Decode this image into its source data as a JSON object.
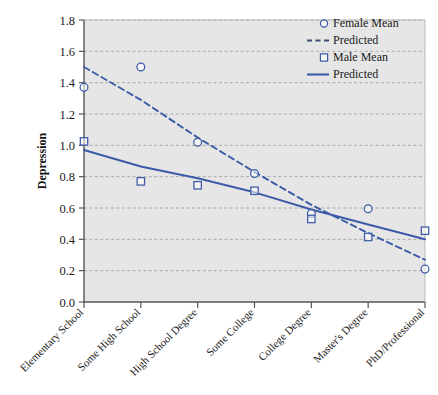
{
  "chart_data": {
    "type": "scatter",
    "title": "",
    "xlabel": "",
    "ylabel": "Depression",
    "ylim": [
      0.0,
      1.8
    ],
    "ytick_step": 0.2,
    "yticks": [
      "0.0",
      "0.2",
      "0.4",
      "0.6",
      "0.8",
      "1.0",
      "1.2",
      "1.4",
      "1.6",
      "1.8"
    ],
    "grid": true,
    "grid_style": "dashed-horizontal",
    "legend_position": "top-right",
    "categories": [
      "Elementary School",
      "Some High School",
      "High School Degree",
      "Some College",
      "College Degree",
      "Master's Degree",
      "PhD/Professional"
    ],
    "series": [
      {
        "name": "Female Mean",
        "marker": "open-circle",
        "style": "markers",
        "color": "#3C5BA6",
        "values": [
          1.37,
          1.5,
          1.02,
          0.82,
          0.565,
          0.595,
          0.21
        ]
      },
      {
        "name": "Predicted",
        "marker": "none",
        "style": "dashed-line",
        "color": "#3C5BA6",
        "values": [
          1.5,
          1.29,
          1.05,
          0.83,
          0.62,
          0.44,
          0.27
        ]
      },
      {
        "name": "Male Mean",
        "marker": "open-square",
        "style": "markers",
        "color": "#3C5BA6",
        "values": [
          1.025,
          0.77,
          0.745,
          0.71,
          0.53,
          0.415,
          0.455
        ]
      },
      {
        "name": "Predicted",
        "marker": "none",
        "style": "solid-line",
        "color": "#3C5BA6",
        "values": [
          0.97,
          0.865,
          0.79,
          0.7,
          0.59,
          0.495,
          0.4
        ]
      }
    ]
  },
  "legend": {
    "entries": [
      {
        "label": "Female Mean",
        "glyph": "open-circle-marker"
      },
      {
        "label": "Predicted",
        "glyph": "dashed-line-swatch"
      },
      {
        "label": "Male Mean",
        "glyph": "open-square-marker"
      },
      {
        "label": "Predicted",
        "glyph": "solid-line-swatch"
      }
    ]
  },
  "colors": {
    "series_blue": "#3C5BA6",
    "plot_background": "#E6E6E6",
    "grid": "#9a9a9a",
    "axis": "#555555",
    "text": "#1a1a1a"
  }
}
